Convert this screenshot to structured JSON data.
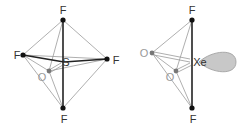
{
  "molecules": [
    {
      "name": "SOF4",
      "central_atom": "S",
      "atoms": {
        "f_top": "F",
        "f_left": "F",
        "f_right": "F",
        "f_bottom": "F",
        "o": "O",
        "center": "S"
      }
    },
    {
      "name": "XeO2F2",
      "central_atom": "Xe",
      "atoms": {
        "f_top": "F",
        "f_bottom": "F",
        "o_left": "O",
        "o_lower": "O",
        "center": "Xe"
      },
      "lone_pair": "lone pair lobe"
    }
  ],
  "colors": {
    "atom_f": "#111111",
    "atom_o": "#777777",
    "bond_thick": "#222222",
    "bond_thin": "#999999",
    "lone_pair_fill": "#c8c8c8",
    "lone_pair_stroke": "#9a9a9a",
    "label": "#333333"
  }
}
